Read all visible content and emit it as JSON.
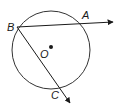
{
  "diagram": {
    "type": "circle-geometry",
    "circle": {
      "center_label": "O"
    },
    "points": [
      {
        "label": "B",
        "role": "vertex-on-circle"
      },
      {
        "label": "A",
        "role": "point-on-circle"
      },
      {
        "label": "C",
        "role": "point-on-circle"
      },
      {
        "label": "O",
        "role": "center"
      }
    ],
    "rays": [
      {
        "from": "B",
        "through": "A"
      },
      {
        "from": "B",
        "through": "C"
      }
    ],
    "colors": {
      "stroke": "#1a1a1a",
      "background": "#ffffff"
    }
  },
  "labels": {
    "A": "A",
    "B": "B",
    "C": "C",
    "O": "O"
  }
}
